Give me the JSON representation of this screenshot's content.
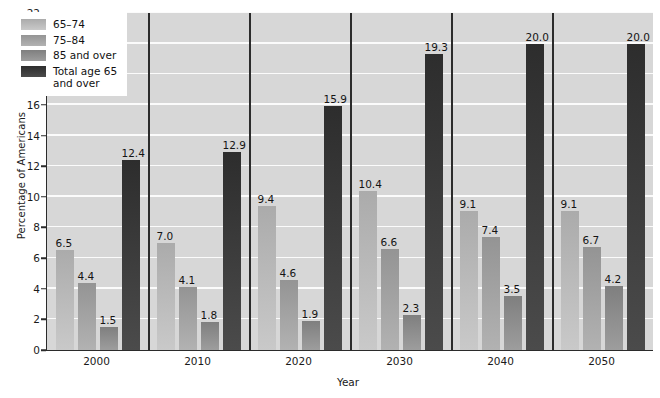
{
  "chart_data": {
    "type": "bar",
    "title": "",
    "xlabel": "Year",
    "ylabel": "Percentage of Americans",
    "categories": [
      "2000",
      "2010",
      "2020",
      "2030",
      "2040",
      "2050"
    ],
    "ylim": [
      0,
      22
    ],
    "yticks": [
      0,
      2,
      4,
      6,
      8,
      10,
      12,
      14,
      16,
      18,
      20,
      22
    ],
    "grid": true,
    "legend_position": "top-left",
    "series": [
      {
        "name": "65–74",
        "color": "#b9b9b9",
        "values": [
          6.5,
          7.0,
          9.4,
          10.4,
          9.1,
          9.1
        ],
        "labels": [
          "6.5",
          "7.0",
          "9.4",
          "10.4",
          "9.1",
          "9.1"
        ]
      },
      {
        "name": "75–84",
        "color": "#a2a2a2",
        "values": [
          4.4,
          4.1,
          4.6,
          6.6,
          7.4,
          6.7
        ],
        "labels": [
          "4.4",
          "4.1",
          "4.6",
          "6.6",
          "7.4",
          "6.7"
        ]
      },
      {
        "name": "85 and over",
        "color": "#8d8d8d",
        "values": [
          1.5,
          1.8,
          1.9,
          2.3,
          3.5,
          4.2
        ],
        "labels": [
          "1.5",
          "1.8",
          "1.9",
          "2.3",
          "3.5",
          "4.2"
        ]
      },
      {
        "name": "Total age 65\nand over",
        "color": "#3b3b3b",
        "values": [
          12.4,
          12.9,
          15.9,
          19.3,
          20.0,
          20.0
        ],
        "labels": [
          "12.4",
          "12.9",
          "15.9",
          "19.3",
          "20.0",
          "20.0"
        ]
      }
    ]
  },
  "legend": {
    "items": [
      {
        "label": "65–74",
        "color": "#b9b9b9"
      },
      {
        "label": "75–84",
        "color": "#a2a2a2"
      },
      {
        "label": "85 and over",
        "color": "#8d8d8d"
      },
      {
        "label": "Total age 65\nand over",
        "color": "#3b3b3b"
      }
    ]
  },
  "axes": {
    "y_title": "Percentage of Americans",
    "x_title": "Year"
  },
  "colors": {
    "plot_background": "#d7d7d7",
    "gridline": "#fbfbfb",
    "axis": "#2b2b2b",
    "text": "#1a1a1a"
  }
}
